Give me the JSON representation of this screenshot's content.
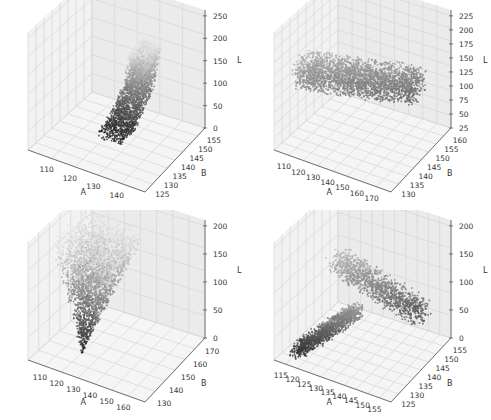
{
  "chart_data": [
    {
      "type": "scatter3d",
      "position": "top-left",
      "title": "",
      "xlabel": "A",
      "ylabel": "B",
      "zlabel": "L",
      "x_ticks": [
        "110",
        "120",
        "130",
        "140"
      ],
      "y_ticks": [
        "125",
        "130",
        "135",
        "140",
        "145",
        "150",
        "155"
      ],
      "z_ticks": [
        "0",
        "50",
        "100",
        "150",
        "200",
        "250"
      ],
      "xlim": [
        104,
        146
      ],
      "ylim": [
        122,
        158
      ],
      "zlim": [
        0,
        255
      ],
      "grid": true,
      "shape": "S-shaped vertical cloud: dark points at low L near A≈120-130, rising to light points at L≈200 near A≈135",
      "color_map": "grayscale by L (dark=low, light=high)"
    },
    {
      "type": "scatter3d",
      "position": "top-right",
      "title": "",
      "xlabel": "A",
      "ylabel": "B",
      "zlabel": "L",
      "x_ticks": [
        "110",
        "120",
        "130",
        "140",
        "150",
        "160",
        "170"
      ],
      "y_ticks": [
        "130",
        "135",
        "140",
        "145",
        "150",
        "155",
        "160"
      ],
      "z_ticks": [
        "25",
        "50",
        "75",
        "100",
        "125",
        "150",
        "175",
        "200",
        "225"
      ],
      "xlim": [
        106,
        172
      ],
      "ylim": [
        128,
        162
      ],
      "zlim": [
        15,
        235
      ],
      "grid": true,
      "shape": "elongated diagonal band spanning A≈115-165, L≈50-175",
      "color_map": "grayscale by L (dark=low, light=high)"
    },
    {
      "type": "scatter3d",
      "position": "bottom-left",
      "title": "",
      "xlabel": "A",
      "ylabel": "B",
      "zlabel": "L",
      "x_ticks": [
        "110",
        "120",
        "130",
        "140",
        "150",
        "160"
      ],
      "y_ticks": [
        "130",
        "140",
        "150",
        "160",
        "170"
      ],
      "z_ticks": [
        "0",
        "50",
        "100",
        "150",
        "200"
      ],
      "xlim": [
        105,
        165
      ],
      "ylim": [
        125,
        175
      ],
      "zlim": [
        0,
        240
      ],
      "grid": true,
      "shape": "triangular fan: dark tip at low L, A≈120; widening to light top at L≈200",
      "color_map": "grayscale by L (dark=low, light=high)"
    },
    {
      "type": "scatter3d",
      "position": "bottom-right",
      "title": "",
      "xlabel": "A",
      "ylabel": "B",
      "zlabel": "L",
      "x_ticks": [
        "115",
        "120",
        "125",
        "130",
        "135",
        "140",
        "145",
        "150",
        "155"
      ],
      "y_ticks": [
        "125",
        "130",
        "135",
        "140",
        "145",
        "150",
        "155"
      ],
      "z_ticks": [
        "0",
        "50",
        "100",
        "150",
        "200"
      ],
      "xlim": [
        112,
        158
      ],
      "ylim": [
        122,
        158
      ],
      "zlim": [
        0,
        240
      ],
      "grid": true,
      "shape": "Y/arrowhead shape: dark cluster at A≈120 low L, light upper wing extending to A≈150",
      "color_map": "grayscale by L (dark=low, light=high)"
    }
  ],
  "colors": {
    "pane_left": "#f2f2f2",
    "pane_right": "#ebebeb",
    "pane_floor": "#f5f5f5",
    "grid": "#d6d6d6",
    "axis": "#555555",
    "point_dark": "#202020",
    "point_light": "#d8d8d8"
  }
}
